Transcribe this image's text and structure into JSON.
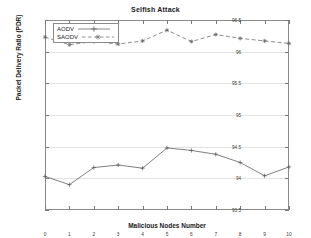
{
  "chart_data": {
    "type": "line",
    "title": "Selfish Attack",
    "xlabel": "Malicious Nodes Number",
    "ylabel": "Packet Delivery Ratio (PDR)",
    "x": [
      0,
      1,
      2,
      3,
      4,
      5,
      6,
      7,
      8,
      9,
      10
    ],
    "xtick_labels": [
      "0",
      "1",
      "2",
      "3",
      "4",
      "5",
      "6",
      "7",
      "8",
      "9",
      "10"
    ],
    "ytick_labels": [
      "93.5",
      "94",
      "94.5",
      "95",
      "95.5",
      "96",
      "96.5"
    ],
    "ytick_values": [
      93.5,
      94,
      94.5,
      95,
      95.5,
      96,
      96.5
    ],
    "xlim": [
      0,
      10
    ],
    "ylim": [
      93.5,
      96.5
    ],
    "grid": true,
    "legend_position": "top-left-inside",
    "series": [
      {
        "name": "AODV",
        "style": "solid",
        "marker": "plus",
        "color": "#555555",
        "values": [
          94.03,
          93.9,
          94.17,
          94.21,
          94.16,
          94.48,
          94.44,
          94.38,
          94.25,
          94.04,
          94.18
        ]
      },
      {
        "name": "SAODV",
        "style": "dashed",
        "marker": "star",
        "color": "#666666",
        "values": [
          96.23,
          96.11,
          96.16,
          96.12,
          96.17,
          96.34,
          96.16,
          96.27,
          96.21,
          96.17,
          96.13
        ]
      }
    ]
  }
}
